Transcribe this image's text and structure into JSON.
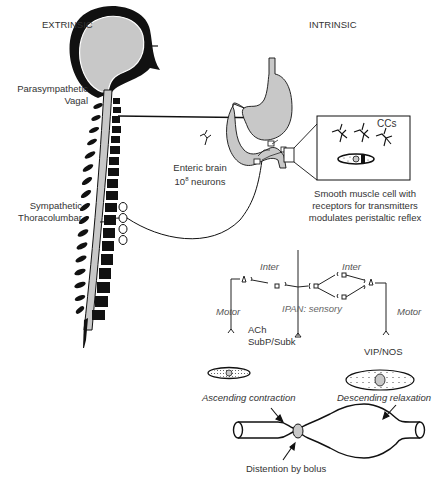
{
  "headings": {
    "extrinsic": "EXTRINSIC",
    "intrinsic": "INTRINSIC"
  },
  "labels": {
    "parasympathetic": "Parasympathetic",
    "vagal": "Vagal",
    "sympathetic": "Sympathetic",
    "thoracolumbar": "Thoracolumbar",
    "enteric_brain": "Enteric brain",
    "neurons_base": "10",
    "neurons_exp": "8",
    "neurons_suffix": " neurons",
    "ccs": "CCs",
    "smooth_muscle_1": "Smooth muscle cell with",
    "smooth_muscle_2": "receptors for transmitters",
    "smooth_muscle_3": "modulates peristaltic reflex"
  },
  "circuit": {
    "inter_left": "Inter",
    "inter_right": "Inter",
    "motor_left": "Motor",
    "motor_right": "Motor",
    "ipan": "IPAN: sensory",
    "ach": "ACh",
    "subp": "SubP/Subk",
    "vip": "VIP/NOS"
  },
  "peristalsis": {
    "ascending": "Ascending contraction",
    "descending": "Descending relaxation",
    "distention": "Distention by bolus"
  },
  "colors": {
    "ink": "#111111",
    "organ_fill": "#c8c8c8",
    "text": "#333333"
  }
}
